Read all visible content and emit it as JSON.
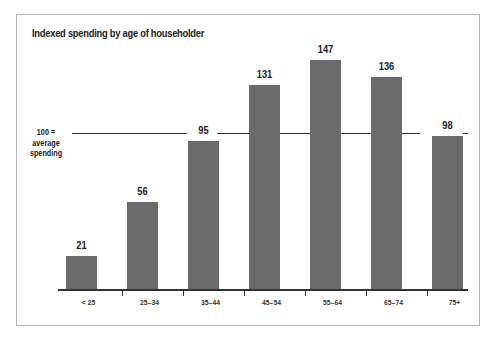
{
  "chart_data": {
    "type": "bar",
    "title": "Indexed spending by age of householder",
    "categories": [
      "< 25",
      "25–34",
      "35–44",
      "45–54",
      "55–64",
      "65–74",
      "75+"
    ],
    "values": [
      21,
      56,
      95,
      131,
      147,
      136,
      98
    ],
    "reference_line": {
      "value": 100,
      "label_line1": "100 =",
      "label_line2": "average",
      "label_line3": "spending"
    },
    "xlabel": "",
    "ylabel": "",
    "ylim": [
      0,
      150
    ],
    "grid": false,
    "bar_color": "#6b6b6b"
  }
}
